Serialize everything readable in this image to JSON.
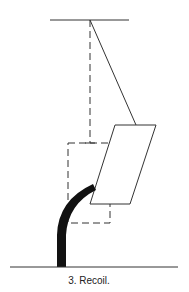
{
  "caption": "3. Recoil.",
  "colors": {
    "line": "#333333",
    "stem": "#111111",
    "background": "#ffffff"
  },
  "diagram": {
    "elements": [
      "ceiling-line",
      "pendulum-string",
      "rest-position-dashed-line",
      "rest-position-dashed-box",
      "displaced-weight-parallelogram",
      "bent-stem",
      "ground-line"
    ]
  }
}
